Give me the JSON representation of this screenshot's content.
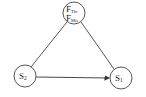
{
  "diagram": {
    "nodes": [
      {
        "id": "F",
        "lines": [
          {
            "main": "F",
            "sub": "Thr"
          },
          {
            "main": "F",
            "sub": "Mis"
          }
        ],
        "cx": 74,
        "cy": 13,
        "r": 11
      },
      {
        "id": "S2",
        "main": "S",
        "sub": "2",
        "cx": 25,
        "cy": 76,
        "r": 11
      },
      {
        "id": "S1",
        "main": "S",
        "sub": "1",
        "cx": 121,
        "cy": 78,
        "r": 11
      }
    ],
    "edges": [
      {
        "from": "F",
        "to": "S2",
        "directed": false
      },
      {
        "from": "F",
        "to": "S1",
        "directed": false
      },
      {
        "from": "S2",
        "to": "S1",
        "directed": true
      }
    ],
    "colors": {
      "stroke": "#333333",
      "background": "#ffffff"
    }
  }
}
